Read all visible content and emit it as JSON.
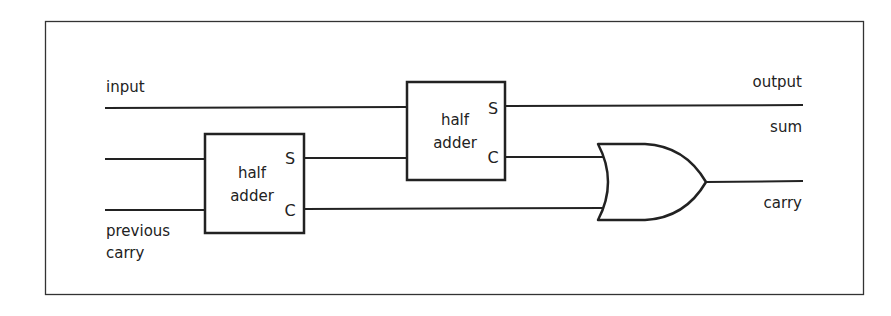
{
  "diagram": {
    "labels": {
      "input": "input",
      "previous_carry_line1": "previous",
      "previous_carry_line2": "carry",
      "output": "output",
      "sum": "sum",
      "carry": "carry"
    },
    "blocks": [
      {
        "id": "half-adder-1",
        "line1": "half",
        "line2": "adder",
        "pin_s": "S",
        "pin_c": "C"
      },
      {
        "id": "half-adder-2",
        "line1": "half",
        "line2": "adder",
        "pin_s": "S",
        "pin_c": "C"
      }
    ],
    "gates": [
      {
        "id": "or-gate",
        "type": "OR"
      }
    ],
    "colors": {
      "stroke": "#222222",
      "background": "#ffffff",
      "frame": "#333333"
    }
  }
}
